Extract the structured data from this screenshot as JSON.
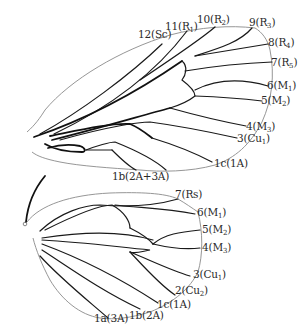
{
  "diagram": {
    "title": "",
    "forewing": {
      "labels": [
        {
          "id": "fw-12",
          "num": "12",
          "vein": "Sc",
          "sub": ""
        },
        {
          "id": "fw-11",
          "num": "11",
          "vein": "R",
          "sub": "1"
        },
        {
          "id": "fw-10",
          "num": "10",
          "vein": "R",
          "sub": "2"
        },
        {
          "id": "fw-9",
          "num": "9",
          "vein": "R",
          "sub": "3"
        },
        {
          "id": "fw-8",
          "num": "8",
          "vein": "R",
          "sub": "4"
        },
        {
          "id": "fw-7",
          "num": "7",
          "vein": "R",
          "sub": "5"
        },
        {
          "id": "fw-6",
          "num": "6",
          "vein": "M",
          "sub": "1"
        },
        {
          "id": "fw-5",
          "num": "5",
          "vein": "M",
          "sub": "2"
        },
        {
          "id": "fw-4",
          "num": "4",
          "vein": "M",
          "sub": "3"
        },
        {
          "id": "fw-3",
          "num": "3",
          "vein": "Cu",
          "sub": "1"
        },
        {
          "id": "fw-1c",
          "num": "1c",
          "vein": "1A",
          "sub": ""
        },
        {
          "id": "fw-1b",
          "num": "1b",
          "vein": "2A+3A",
          "sub": ""
        }
      ]
    },
    "hindwing": {
      "labels": [
        {
          "id": "hw-7",
          "num": "7",
          "vein": "Rs",
          "sub": ""
        },
        {
          "id": "hw-6",
          "num": "6",
          "vein": "M",
          "sub": "1"
        },
        {
          "id": "hw-5",
          "num": "5",
          "vein": "M",
          "sub": "2"
        },
        {
          "id": "hw-4",
          "num": "4",
          "vein": "M",
          "sub": "3"
        },
        {
          "id": "hw-3",
          "num": "3",
          "vein": "Cu",
          "sub": "1"
        },
        {
          "id": "hw-2",
          "num": "2",
          "vein": "Cu",
          "sub": "2"
        },
        {
          "id": "hw-1c",
          "num": "1c",
          "vein": "1A",
          "sub": ""
        },
        {
          "id": "hw-1b",
          "num": "1b",
          "vein": "2A",
          "sub": ""
        },
        {
          "id": "hw-1a",
          "num": "1a",
          "vein": "3A",
          "sub": ""
        }
      ]
    },
    "colors": {
      "outline": "#8a8a8a",
      "vein": "#1a1a1a",
      "text": "#2a2a2a",
      "background": "#ffffff"
    }
  }
}
